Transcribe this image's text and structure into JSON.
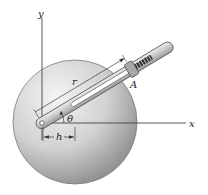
{
  "diagram": {
    "type": "mechanics-figure",
    "labels": {
      "y_axis": "y",
      "x_axis": "x",
      "radius": "r",
      "angle": "θ",
      "offset": "h",
      "point": "A"
    },
    "colors": {
      "disc_light": "#f2f2f2",
      "disc_dark": "#8f8f8f",
      "rod_fill": "#d4d4d4",
      "rod_edge": "#555555",
      "axis": "#444444",
      "background": "#ffffff"
    }
  }
}
